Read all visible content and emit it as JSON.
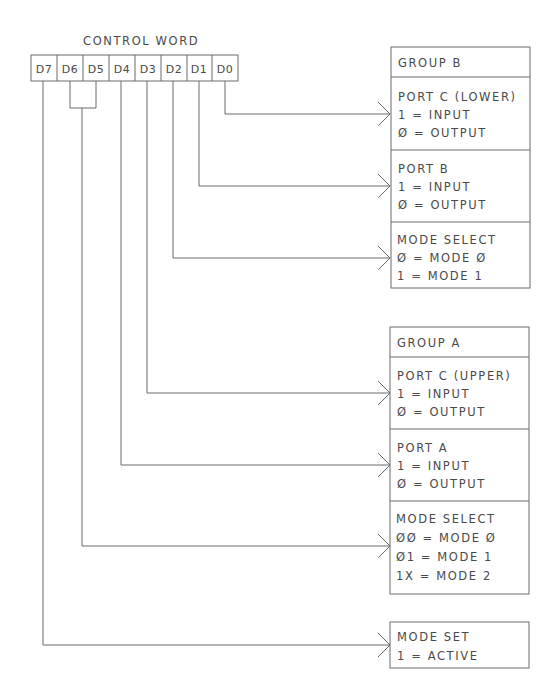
{
  "diagram": {
    "title": "CONTROL WORD",
    "bits": [
      "D7",
      "D6",
      "D5",
      "D4",
      "D3",
      "D2",
      "D1",
      "D0"
    ],
    "groups": [
      {
        "header": "GROUP B",
        "sections": [
          {
            "title": "PORT C (LOWER)",
            "lines": [
              "1 = INPUT",
              "Ø = OUTPUT"
            ],
            "source_bit": "D0"
          },
          {
            "title": "PORT B",
            "lines": [
              "1 = INPUT",
              "Ø = OUTPUT"
            ],
            "source_bit": "D1"
          },
          {
            "title": "MODE SELECT",
            "lines": [
              "Ø = MODE Ø",
              "1 = MODE 1"
            ],
            "source_bit": "D2"
          }
        ]
      },
      {
        "header": "GROUP A",
        "sections": [
          {
            "title": "PORT C (UPPER)",
            "lines": [
              "1 = INPUT",
              "Ø = OUTPUT"
            ],
            "source_bit": "D3"
          },
          {
            "title": "PORT A",
            "lines": [
              "1 = INPUT",
              "Ø = OUTPUT"
            ],
            "source_bit": "D4"
          },
          {
            "title": "MODE SELECT",
            "lines": [
              "ØØ = MODE Ø",
              "Ø1 = MODE 1",
              "1X = MODE 2"
            ],
            "source_bit": "D6-D5"
          }
        ]
      }
    ],
    "mode_set": {
      "title": "MODE SET",
      "lines": [
        "1 = ACTIVE"
      ],
      "source_bit": "D7"
    },
    "colors": {
      "line": "#6b6b6b",
      "text": "#4a4a4a",
      "background": "#ffffff"
    }
  }
}
